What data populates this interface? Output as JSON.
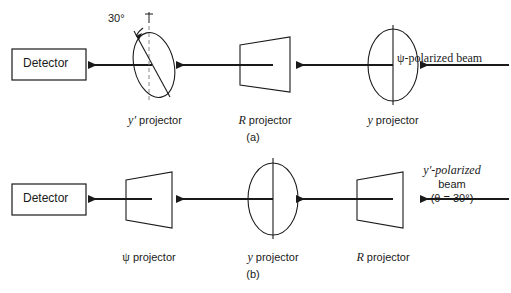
{
  "figure": {
    "type": "optics-polarizer-schematic",
    "stroke_color": "#1a1a1a",
    "background_color": "#ffffff",
    "beam_direction": "right-to-left",
    "panels": [
      {
        "id": "a",
        "caption": "(a)",
        "detector_label": "Detector",
        "beam_source_label": "ψ-polarized beam",
        "angle_annotation": "30°",
        "elements": [
          {
            "name": "y-prime-projector",
            "label_var": "y′",
            "label_rest": " projector",
            "shape": "tilted-ellipse"
          },
          {
            "name": "r-projector",
            "label_var": "R",
            "label_rest": " projector",
            "shape": "parallelogram"
          },
          {
            "name": "y-projector",
            "label_var": "y",
            "label_rest": " projector",
            "shape": "upright-ellipse"
          }
        ]
      },
      {
        "id": "b",
        "caption": "(b)",
        "detector_label": "Detector",
        "beam_source_line1": "y′-polarized",
        "beam_source_line2": "beam",
        "beam_source_line3": "(θ = 30°)",
        "elements": [
          {
            "name": "psi-projector",
            "label_var": "ψ",
            "label_rest": " projector",
            "shape": "parallelogram"
          },
          {
            "name": "y-projector",
            "label_var": "y",
            "label_rest": " projector",
            "shape": "upright-ellipse"
          },
          {
            "name": "r-projector",
            "label_var": "R",
            "label_rest": " projector",
            "shape": "parallelogram"
          }
        ]
      }
    ]
  }
}
